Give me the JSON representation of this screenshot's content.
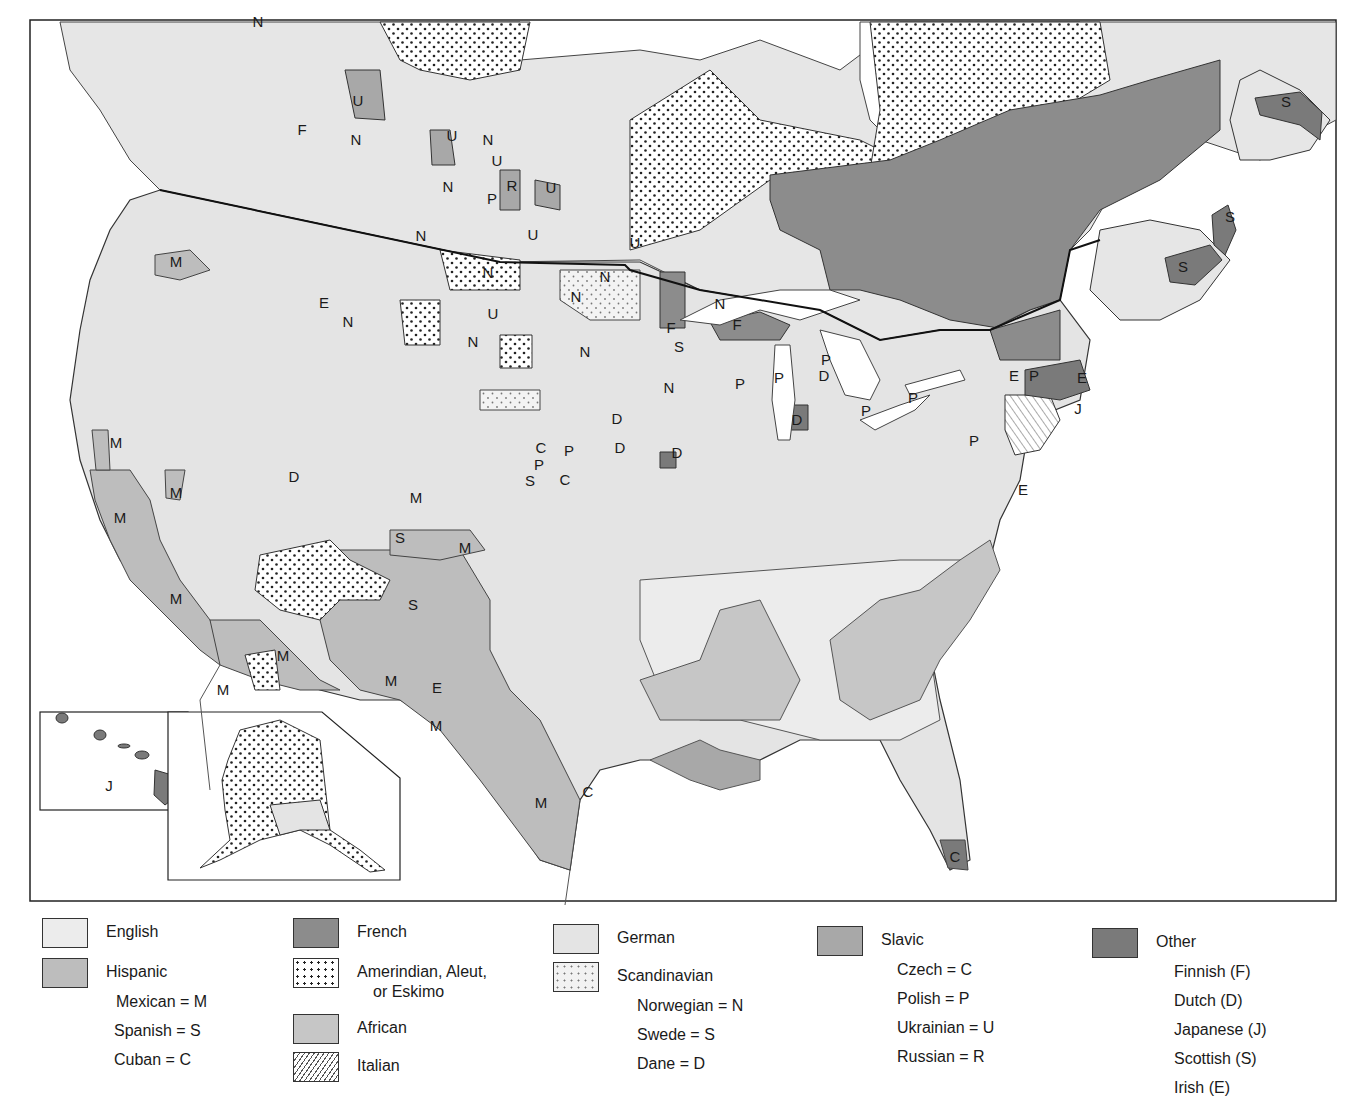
{
  "map": {
    "title": "",
    "frame_color": "#222222",
    "fill_colors": {
      "english": "#ececec",
      "hispanic": "#bdbdbd",
      "french": "#8c8c8c",
      "african": "#c6c6c6",
      "german": "#e4e4e4",
      "slavic": "#a8a8a8",
      "other": "#7a7a7a",
      "water": "#ffffff"
    },
    "region_labels": [
      {
        "text": "N",
        "x": 258,
        "y": 27
      },
      {
        "text": "U",
        "x": 358,
        "y": 106
      },
      {
        "text": "F",
        "x": 302,
        "y": 135
      },
      {
        "text": "N",
        "x": 356,
        "y": 145
      },
      {
        "text": "U",
        "x": 452,
        "y": 141
      },
      {
        "text": "N",
        "x": 488,
        "y": 145
      },
      {
        "text": "U",
        "x": 497,
        "y": 166
      },
      {
        "text": "R",
        "x": 512,
        "y": 191
      },
      {
        "text": "P",
        "x": 492,
        "y": 204
      },
      {
        "text": "N",
        "x": 448,
        "y": 192
      },
      {
        "text": "U",
        "x": 551,
        "y": 193
      },
      {
        "text": "N",
        "x": 421,
        "y": 241
      },
      {
        "text": "U",
        "x": 533,
        "y": 240
      },
      {
        "text": "U",
        "x": 635,
        "y": 248
      },
      {
        "text": "M",
        "x": 176,
        "y": 267
      },
      {
        "text": "E",
        "x": 324,
        "y": 308
      },
      {
        "text": "N",
        "x": 348,
        "y": 327
      },
      {
        "text": "N",
        "x": 488,
        "y": 278
      },
      {
        "text": "U",
        "x": 493,
        "y": 319
      },
      {
        "text": "N",
        "x": 576,
        "y": 302
      },
      {
        "text": "N",
        "x": 605,
        "y": 282
      },
      {
        "text": "N",
        "x": 720,
        "y": 309
      },
      {
        "text": "F",
        "x": 671,
        "y": 333
      },
      {
        "text": "F",
        "x": 737,
        "y": 330
      },
      {
        "text": "S",
        "x": 679,
        "y": 352
      },
      {
        "text": "N",
        "x": 473,
        "y": 347
      },
      {
        "text": "N",
        "x": 585,
        "y": 357
      },
      {
        "text": "N",
        "x": 669,
        "y": 393
      },
      {
        "text": "P",
        "x": 740,
        "y": 389
      },
      {
        "text": "P",
        "x": 779,
        "y": 383
      },
      {
        "text": "P",
        "x": 826,
        "y": 365
      },
      {
        "text": "D",
        "x": 824,
        "y": 381
      },
      {
        "text": "D",
        "x": 797,
        "y": 425
      },
      {
        "text": "P",
        "x": 866,
        "y": 416
      },
      {
        "text": "P",
        "x": 913,
        "y": 403
      },
      {
        "text": "E",
        "x": 1014,
        "y": 381
      },
      {
        "text": "P",
        "x": 1034,
        "y": 381
      },
      {
        "text": "E",
        "x": 1082,
        "y": 383
      },
      {
        "text": "J",
        "x": 1078,
        "y": 414
      },
      {
        "text": "P",
        "x": 974,
        "y": 446
      },
      {
        "text": "E",
        "x": 1023,
        "y": 495
      },
      {
        "text": "D",
        "x": 617,
        "y": 424
      },
      {
        "text": "C",
        "x": 541,
        "y": 453
      },
      {
        "text": "P",
        "x": 569,
        "y": 456
      },
      {
        "text": "P",
        "x": 539,
        "y": 470
      },
      {
        "text": "S",
        "x": 530,
        "y": 486
      },
      {
        "text": "C",
        "x": 565,
        "y": 485
      },
      {
        "text": "D",
        "x": 620,
        "y": 453
      },
      {
        "text": "D",
        "x": 677,
        "y": 458
      },
      {
        "text": "M",
        "x": 116,
        "y": 448
      },
      {
        "text": "D",
        "x": 294,
        "y": 482
      },
      {
        "text": "M",
        "x": 176,
        "y": 498
      },
      {
        "text": "M",
        "x": 120,
        "y": 523
      },
      {
        "text": "M",
        "x": 416,
        "y": 503
      },
      {
        "text": "S",
        "x": 400,
        "y": 543
      },
      {
        "text": "M",
        "x": 465,
        "y": 553
      },
      {
        "text": "M",
        "x": 176,
        "y": 604
      },
      {
        "text": "S",
        "x": 413,
        "y": 610
      },
      {
        "text": "M",
        "x": 223,
        "y": 695
      },
      {
        "text": "M",
        "x": 283,
        "y": 661
      },
      {
        "text": "M",
        "x": 391,
        "y": 686
      },
      {
        "text": "E",
        "x": 437,
        "y": 693
      },
      {
        "text": "M",
        "x": 436,
        "y": 731
      },
      {
        "text": "C",
        "x": 588,
        "y": 797
      },
      {
        "text": "M",
        "x": 541,
        "y": 808
      },
      {
        "text": "C",
        "x": 955,
        "y": 862
      },
      {
        "text": "S",
        "x": 1286,
        "y": 107
      },
      {
        "text": "S",
        "x": 1230,
        "y": 222
      },
      {
        "text": "S",
        "x": 1183,
        "y": 272
      },
      {
        "text": "J",
        "x": 109,
        "y": 791
      }
    ],
    "insets": [
      {
        "name": "Hawaii",
        "label": "J"
      },
      {
        "name": "Alaska",
        "label": ""
      }
    ]
  },
  "legend": {
    "columns": [
      {
        "items": [
          {
            "key": "english",
            "label": "English",
            "subs": []
          },
          {
            "key": "hispanic",
            "label": "Hispanic",
            "subs": [
              "Mexican = M",
              "Spanish = S",
              "Cuban = C"
            ]
          }
        ]
      },
      {
        "items": [
          {
            "key": "french",
            "label": "French",
            "subs": []
          },
          {
            "key": "amer",
            "label": "Amerindian, Aleut,",
            "label2": "or Eskimo",
            "subs": []
          },
          {
            "key": "african",
            "label": "African",
            "subs": []
          },
          {
            "key": "italian",
            "label": "Italian",
            "subs": []
          }
        ]
      },
      {
        "items": [
          {
            "key": "german",
            "label": "German",
            "subs": []
          },
          {
            "key": "scand",
            "label": "Scandinavian",
            "subs": [
              "Norwegian = N",
              "Swede = S",
              "Dane = D"
            ]
          }
        ]
      },
      {
        "items": [
          {
            "key": "slavic",
            "label": "Slavic",
            "subs": [
              "Czech = C",
              "Polish = P",
              "Ukrainian = U",
              "Russian = R"
            ]
          }
        ]
      },
      {
        "items": [
          {
            "key": "other",
            "label": "Other",
            "subs": [
              "Finnish (F)",
              "Dutch (D)",
              "Japanese (J)",
              "Scottish (S)",
              "Irish (E)"
            ]
          }
        ]
      }
    ]
  }
}
